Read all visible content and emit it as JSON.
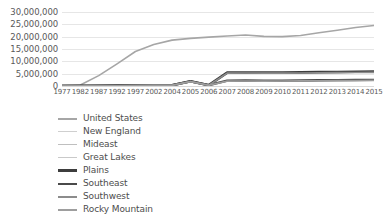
{
  "chart_data": {
    "type": "line",
    "title": "",
    "xlabel": "",
    "ylabel": "",
    "grid": true,
    "legend_position": "bottom-left",
    "ylim": [
      0,
      30000000
    ],
    "ytick_labels": [
      "30,000,000",
      "25,000,000",
      "20,000,000",
      "15,000,000",
      "10,000,000",
      "5,000,000",
      "0"
    ],
    "ytick_values": [
      30000000,
      25000000,
      20000000,
      15000000,
      10000000,
      5000000,
      0
    ],
    "categories": [
      "1977",
      "1982",
      "1987",
      "1992",
      "1997",
      "2002",
      "2004",
      "2005",
      "2006",
      "2007",
      "2008",
      "2009",
      "2010",
      "2011",
      "2012",
      "2013",
      "2014",
      "2015"
    ],
    "series": [
      {
        "name": "United States",
        "color": "#a6a6a6",
        "width": 1.6,
        "values": [
          250000,
          400000,
          4200000,
          9000000,
          14000000,
          16800000,
          18600000,
          19300000,
          19800000,
          20300000,
          20700000,
          20100000,
          20000000,
          20500000,
          21600000,
          22600000,
          23700000,
          24500000
        ]
      },
      {
        "name": "New England",
        "color": "#cfcfcf",
        "width": 1.2,
        "values": [
          20000,
          30000,
          60000,
          120000,
          180000,
          230000,
          270000,
          1900000,
          300000,
          2000000,
          2050000,
          2000000,
          2020000,
          2080000,
          2150000,
          2200000,
          2260000,
          2300000
        ]
      },
      {
        "name": "Mideast",
        "color": "#bfbfbf",
        "width": 1.2,
        "values": [
          30000,
          45000,
          90000,
          160000,
          230000,
          290000,
          330000,
          1850000,
          340000,
          2100000,
          2150000,
          2100000,
          2120000,
          2180000,
          2250000,
          2320000,
          2380000,
          2420000
        ]
      },
      {
        "name": "Great Lakes",
        "color": "#c9c9c9",
        "width": 1.2,
        "values": [
          25000,
          38000,
          75000,
          140000,
          200000,
          260000,
          300000,
          1800000,
          320000,
          5300000,
          5350000,
          5300000,
          5320000,
          5400000,
          5480000,
          5550000,
          5620000,
          5680000
        ]
      },
      {
        "name": "Plains",
        "color": "#3d3d3d",
        "width": 2.6,
        "values": [
          28000,
          42000,
          82000,
          150000,
          215000,
          275000,
          315000,
          1950000,
          330000,
          5450000,
          5500000,
          5460000,
          5480000,
          5540000,
          5620000,
          5700000,
          5770000,
          5830000
        ]
      },
      {
        "name": "Southeast",
        "color": "#4a4a4a",
        "width": 2.4,
        "values": [
          26000,
          40000,
          78000,
          145000,
          208000,
          268000,
          308000,
          1880000,
          325000,
          2150000,
          2200000,
          2160000,
          2180000,
          2240000,
          2310000,
          2380000,
          2440000,
          2490000
        ]
      },
      {
        "name": "Southwest",
        "color": "#8c8c8c",
        "width": 1.6,
        "values": [
          22000,
          35000,
          70000,
          130000,
          190000,
          245000,
          285000,
          1820000,
          305000,
          5200000,
          5250000,
          5210000,
          5230000,
          5290000,
          5360000,
          5430000,
          5490000,
          5540000
        ]
      },
      {
        "name": "Rocky Mountain",
        "color": "#9e9e9e",
        "width": 1.6,
        "values": [
          21000,
          33000,
          66000,
          125000,
          185000,
          238000,
          278000,
          1780000,
          298000,
          1980000,
          2030000,
          1990000,
          2010000,
          2060000,
          2130000,
          2190000,
          2250000,
          2300000
        ]
      }
    ]
  }
}
